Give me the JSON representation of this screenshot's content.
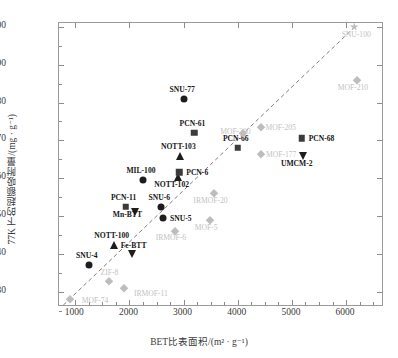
{
  "chart_data": {
    "type": "scatter",
    "title": "",
    "xlabel": "BET比表面积/(m² · g⁻¹)",
    "ylabel": "77K 下的超额吸附量/(mg · g⁻¹)",
    "xlim": [
      700,
      6700
    ],
    "ylim": [
      26,
      101
    ],
    "xticks": [
      1000,
      2000,
      3000,
      4000,
      5000,
      6000
    ],
    "yticks": [
      30,
      40,
      50,
      60,
      70,
      80,
      90,
      100
    ],
    "xticklabels": [
      "1000",
      "2000",
      "3000",
      "4000",
      "5000",
      "6000"
    ],
    "yticklabels": [
      "30",
      "40",
      "50",
      "60",
      "70",
      "80",
      "90",
      "100"
    ],
    "grid": false,
    "legend": "none",
    "trendline": {
      "type": "dashed-linear",
      "x0": 780,
      "y0": 26.5,
      "x1": 6200,
      "y1": 100.5
    },
    "points": [
      {
        "label": "MOF-74",
        "x": 900,
        "y": 28.0,
        "marker": "diamond",
        "color": "#bdbdbd",
        "lx": 12,
        "ly": 2
      },
      {
        "label": "SNU-4",
        "x": 1250,
        "y": 37.0,
        "marker": "circle",
        "color": "#1d1d1d",
        "lx": -2,
        "ly": -9
      },
      {
        "label": "ZIF-8",
        "x": 1630,
        "y": 32.8,
        "marker": "diamond",
        "color": "#bdbdbd",
        "lx": 0,
        "ly": -8
      },
      {
        "label": "IRMOF-11",
        "x": 1900,
        "y": 31.0,
        "marker": "diamond",
        "color": "#bdbdbd",
        "lx": 10,
        "ly": 6
      },
      {
        "label": "NOTT-100",
        "x": 1710,
        "y": 42.5,
        "marker": "tri-up",
        "color": "#1d1d1d",
        "lx": -2,
        "ly": -9
      },
      {
        "label": "Fe-BTT",
        "x": 2040,
        "y": 40.0,
        "marker": "tri-dn",
        "color": "#1d1d1d",
        "lx": 2,
        "ly": -8
      },
      {
        "label": "PCN-11",
        "x": 1930,
        "y": 52.5,
        "marker": "square",
        "color": "#3b3b3b",
        "lx": -2,
        "ly": -9
      },
      {
        "label": "Mn-BTT",
        "x": 2100,
        "y": 51.0,
        "marker": "tri-dn",
        "color": "#1d1d1d",
        "lx": -22,
        "ly": 3
      },
      {
        "label": "SNU-6",
        "x": 2590,
        "y": 52.4,
        "marker": "circle",
        "color": "#1d1d1d",
        "lx": -2,
        "ly": -9
      },
      {
        "label": "SNU-5",
        "x": 2620,
        "y": 49.5,
        "marker": "circle",
        "color": "#1d1d1d",
        "lx": 7,
        "ly": 1
      },
      {
        "label": "IRMOF-6",
        "x": 2840,
        "y": 46.0,
        "marker": "diamond",
        "color": "#bdbdbd",
        "lx": -4,
        "ly": 7
      },
      {
        "label": "MOF-5",
        "x": 3490,
        "y": 49.0,
        "marker": "diamond",
        "color": "#bdbdbd",
        "lx": -4,
        "ly": 8
      },
      {
        "label": "MIL-100",
        "x": 2250,
        "y": 59.6,
        "marker": "circle",
        "color": "#1d1d1d",
        "lx": -2,
        "ly": -9
      },
      {
        "label": "NOTT-103",
        "x": 2940,
        "y": 65.8,
        "marker": "tri-up",
        "color": "#1d1d1d",
        "lx": -2,
        "ly": -9
      },
      {
        "label": "NOTT-102",
        "x": 2890,
        "y": 60.2,
        "marker": "tri-up",
        "color": "#1d1d1d",
        "lx": -6,
        "ly": 8
      },
      {
        "label": "PCN-6",
        "x": 2920,
        "y": 61.6,
        "marker": "square",
        "color": "#3b3b3b",
        "lx": 7,
        "ly": 1
      },
      {
        "label": "PCN-61",
        "x": 3200,
        "y": 72.0,
        "marker": "square",
        "color": "#3b3b3b",
        "lx": -2,
        "ly": -9
      },
      {
        "label": "IRMOF-20",
        "x": 3570,
        "y": 56.0,
        "marker": "diamond",
        "color": "#bdbdbd",
        "lx": -4,
        "ly": 8
      },
      {
        "label": "PCN-66",
        "x": 4000,
        "y": 68.0,
        "marker": "square",
        "color": "#3b3b3b",
        "lx": -2,
        "ly": -9
      },
      {
        "label": "SNU-77",
        "x": 3010,
        "y": 81.0,
        "marker": "circle",
        "color": "#1d1d1d",
        "lx": -2,
        "ly": -9
      },
      {
        "label": "MOF-200",
        "x": 4100,
        "y": 72.0,
        "marker": "diamond",
        "color": "#bdbdbd",
        "lx": -23,
        "ly": -1
      },
      {
        "label": "MOF-205",
        "x": 4420,
        "y": 73.5,
        "marker": "diamond",
        "color": "#bdbdbd",
        "lx": 5,
        "ly": 1
      },
      {
        "label": "MOF-177",
        "x": 4430,
        "y": 66.5,
        "marker": "diamond",
        "color": "#bdbdbd",
        "lx": 5,
        "ly": 1
      },
      {
        "label": "PCN-68",
        "x": 5180,
        "y": 70.5,
        "marker": "square",
        "color": "#3b3b3b",
        "lx": 7,
        "ly": 1
      },
      {
        "label": "UMCM-2",
        "x": 5200,
        "y": 66.0,
        "marker": "tri-dn",
        "color": "#1d1d1d",
        "lx": -6,
        "ly": 8
      },
      {
        "label": "MOF-210",
        "x": 6200,
        "y": 86.0,
        "marker": "diamond",
        "color": "#bdbdbd",
        "lx": -4,
        "ly": 8
      },
      {
        "label": "SNU-100",
        "x": 6150,
        "y": 100.0,
        "marker": "star",
        "color": "#bdbdbd",
        "lx": 2,
        "ly": 8
      }
    ]
  },
  "axes": {
    "x_title": "BET比表面积/(m² · g⁻¹)",
    "y_title": "77K 下的超额吸附量/(mg · g⁻¹)"
  }
}
